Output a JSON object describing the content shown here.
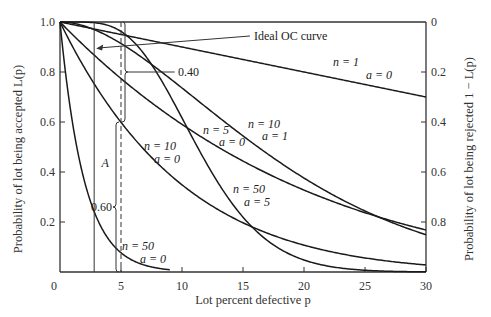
{
  "chart_data": {
    "type": "line",
    "title": "",
    "xlabel": "Lot percent defective p",
    "ylabel": "Probability of lot being accepted L(p)",
    "ylabel_right": "Probability of lot being rejected 1 − L(p)",
    "xlim": [
      0,
      30
    ],
    "ylim": [
      0,
      1.0
    ],
    "x_ticks": [
      0,
      5,
      10,
      15,
      20,
      25,
      30
    ],
    "y_ticks": [
      0.2,
      0.4,
      0.6,
      0.8,
      1.0
    ],
    "y_tick_labels": [
      "0.2",
      "0.4",
      "0.6",
      "0.8",
      "1.0"
    ],
    "y_right_ticks": [
      0.2,
      0.4,
      0.6,
      0.8
    ],
    "y_right_tick_labels": [
      "0",
      "0.2",
      "0.4",
      "0.6",
      "0.8"
    ],
    "origin_label": "0",
    "grid": false,
    "series": [
      {
        "name": "n=1, a=0",
        "n": 1,
        "a": 0,
        "x_end": 30,
        "label_n": "n = 1",
        "label_a": "a = 0",
        "label_pos": [
          333,
          66
        ],
        "label_a_pos": [
          366,
          79
        ],
        "values_at": {
          "x": [
            0,
            5,
            10,
            15,
            20,
            25,
            30
          ],
          "y": [
            1.0,
            0.95,
            0.9,
            0.85,
            0.8,
            0.75,
            0.7
          ]
        }
      },
      {
        "name": "n=5, a=0",
        "n": 5,
        "a": 0,
        "x_end": 30,
        "label_n": "n = 5",
        "label_a": "a = 0",
        "label_pos": [
          203,
          134
        ],
        "label_a_pos": [
          219,
          146
        ],
        "values_at": {
          "x": [
            0,
            5,
            10,
            15,
            20,
            25,
            30
          ],
          "y": [
            1.0,
            0.774,
            0.59,
            0.444,
            0.328,
            0.237,
            0.168
          ]
        }
      },
      {
        "name": "n=10, a=0",
        "n": 10,
        "a": 0,
        "x_end": 30,
        "label_n": "n = 10",
        "label_a": "a = 0",
        "label_pos": [
          144,
          150
        ],
        "label_a_pos": [
          154,
          163
        ],
        "values_at": {
          "x": [
            0,
            5,
            10,
            15,
            20,
            25,
            30
          ],
          "y": [
            1.0,
            0.599,
            0.349,
            0.197,
            0.107,
            0.056,
            0.028
          ]
        }
      },
      {
        "name": "n=10, a=1",
        "n": 10,
        "a": 1,
        "x_end": 30,
        "label_n": "n = 10",
        "label_a": "a = 1",
        "label_pos": [
          248,
          128
        ],
        "label_a_pos": [
          262,
          140
        ],
        "values_at": {
          "x": [
            0,
            5,
            10,
            15,
            20,
            25,
            30
          ],
          "y": [
            1.0,
            0.914,
            0.736,
            0.544,
            0.376,
            0.244,
            0.149
          ]
        }
      },
      {
        "name": "n=50, a=0",
        "n": 50,
        "a": 0,
        "x_end": 9,
        "label_n": "n = 50",
        "label_a": "a = 0",
        "label_pos": [
          122,
          250
        ],
        "label_a_pos": [
          140,
          263
        ],
        "values_at": {
          "x": [
            0,
            2,
            4,
            5,
            6,
            8,
            9
          ],
          "y": [
            1.0,
            0.364,
            0.13,
            0.077,
            0.045,
            0.015,
            0.009
          ]
        }
      },
      {
        "name": "n=50, a=5",
        "n": 50,
        "a": 5,
        "x_end": 30,
        "label_n": "n = 50",
        "label_a": "a = 5",
        "label_pos": [
          233,
          193
        ],
        "label_a_pos": [
          244,
          206
        ],
        "values_at": {
          "x": [
            0,
            5,
            10,
            15,
            20,
            25,
            30
          ],
          "y": [
            1.0,
            0.962,
            0.616,
            0.219,
            0.048,
            0.007,
            0.001
          ]
        }
      }
    ],
    "annotations": {
      "ideal_label": "Ideal OC curve",
      "ideal_p": 2.8,
      "dashed_p": 5,
      "upper_bracket_label": "0.40",
      "lower_bracket_label": "0.60",
      "region_label": "A",
      "bracket_split_L": 0.6
    }
  }
}
